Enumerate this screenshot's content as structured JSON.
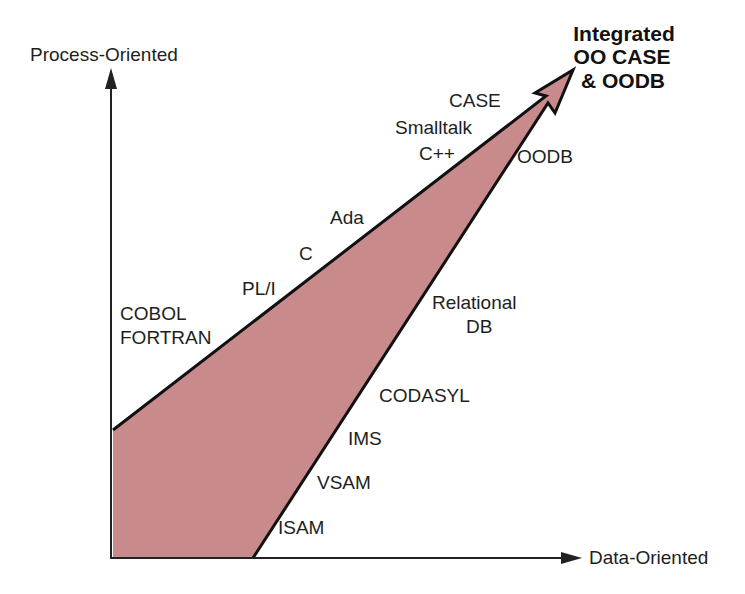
{
  "diagram": {
    "axes": {
      "y_label": "Process-Oriented",
      "x_label": "Data-Oriented"
    },
    "goal": {
      "lines": [
        "Integrated",
        "OO CASE",
        "& OODB"
      ]
    },
    "process_track": {
      "labels": [
        "COBOL",
        "FORTRAN",
        "PL/I",
        "C",
        "Ada",
        "C++",
        "Smalltalk",
        "CASE"
      ]
    },
    "data_track": {
      "labels": [
        "ISAM",
        "VSAM",
        "IMS",
        "CODASYL",
        "Relational",
        "DB",
        "OODB"
      ]
    },
    "colors": {
      "fill": "#c98a8c",
      "stroke": "#111111",
      "axis": "#222222"
    }
  }
}
